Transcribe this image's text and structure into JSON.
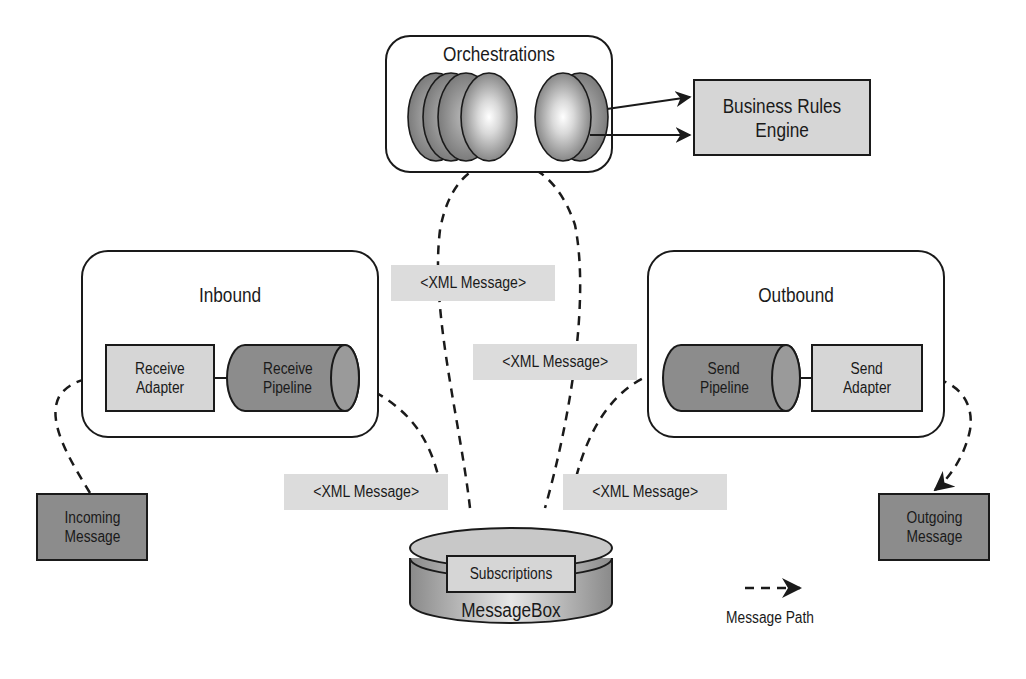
{
  "diagram": {
    "orchestrations": {
      "title": "Orchestrations"
    },
    "business_rules": {
      "line1": "Business Rules",
      "line2": "Engine"
    },
    "inbound": {
      "title": "Inbound",
      "receive_adapter": {
        "line1": "Receive",
        "line2": "Adapter"
      },
      "receive_pipeline": {
        "line1": "Receive",
        "line2": "Pipeline"
      }
    },
    "outbound": {
      "title": "Outbound",
      "send_pipeline": {
        "line1": "Send",
        "line2": "Pipeline"
      },
      "send_adapter": {
        "line1": "Send",
        "line2": "Adapter"
      }
    },
    "incoming_message": {
      "line1": "Incoming",
      "line2": "Message"
    },
    "outgoing_message": {
      "line1": "Outgoing",
      "line2": "Message"
    },
    "messagebox": {
      "title": "MessageBox",
      "subscriptions": "Subscriptions"
    },
    "xml_labels": [
      "<XML Message>",
      "<XML Message>",
      "<XML Message>",
      "<XML Message>"
    ],
    "legend": {
      "label": "Message Path"
    },
    "colors": {
      "light_box": "#d6d6d6",
      "dark_box": "#8c8c8c",
      "xml_bg": "#dcdcdc",
      "stroke": "#1a1a1a"
    }
  }
}
